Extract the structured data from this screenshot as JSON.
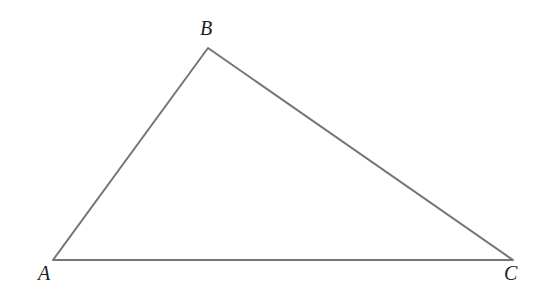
{
  "figure": {
    "type": "triangle-diagram",
    "background_color": "#ffffff",
    "stroke_color": "#757575",
    "stroke_width": 2,
    "label_color": "#1d1d1d",
    "canvas": {
      "width": 538,
      "height": 303
    },
    "vertices": [
      {
        "id": "A",
        "label": "A",
        "x": 53,
        "y": 260,
        "label_x": 45,
        "label_y": 277
      },
      {
        "id": "B",
        "label": "B",
        "x": 208,
        "y": 48,
        "label_x": 207,
        "label_y": 32
      },
      {
        "id": "C",
        "label": "C",
        "x": 513,
        "y": 260,
        "label_x": 511,
        "label_y": 277
      }
    ],
    "edges": [
      {
        "id": "AB",
        "from": "A",
        "to": "B"
      },
      {
        "id": "BC",
        "from": "B",
        "to": "C"
      },
      {
        "id": "CA",
        "from": "C",
        "to": "A"
      }
    ],
    "path": "M 53 260 L 208 48 L 513 260 Z"
  }
}
